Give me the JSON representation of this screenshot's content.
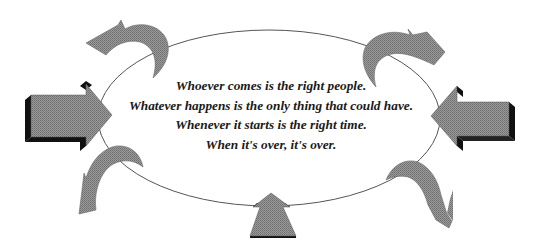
{
  "diagram": {
    "quote_lines": [
      "Whoever comes is the right people.",
      "Whatever happens is the only thing that could have.",
      "Whenever it starts is the right time.",
      "When it's over, it's over."
    ],
    "colors": {
      "arrow_fill": "#8c8c8c",
      "arrow_shadow": "#111111",
      "ellipse_stroke": "#555555",
      "text": "#1a1a1a",
      "background": "#ffffff"
    },
    "shapes": {
      "ellipse": {
        "cx": 269,
        "cy": 118,
        "rx": 171,
        "ry": 88
      },
      "straight_arrows": [
        "left-pointing-right",
        "right-pointing-left",
        "bottom-pointing-up"
      ],
      "curved_arrows": [
        "top-left",
        "top-right",
        "bottom-left",
        "bottom-right"
      ]
    }
  }
}
